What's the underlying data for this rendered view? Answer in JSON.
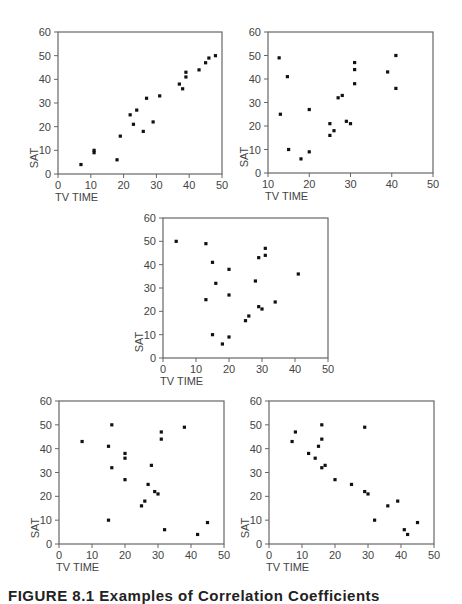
{
  "caption": "FIGURE 8.1 Examples of Correlation Coefficients",
  "chart_data": [
    {
      "type": "scatter",
      "title": "",
      "xlabel": "TV TIME",
      "ylabel": "SAT",
      "xlim": [
        0,
        50
      ],
      "ylim": [
        0,
        60
      ],
      "xticks": [
        0,
        10,
        20,
        30,
        40,
        50
      ],
      "yticks": [
        0,
        10,
        20,
        30,
        40,
        50,
        60
      ],
      "frame": {
        "x0": 58,
        "x1": 222,
        "y0": 32,
        "y1": 174
      },
      "points": [
        [
          7,
          4
        ],
        [
          11,
          9
        ],
        [
          11,
          10
        ],
        [
          18,
          6
        ],
        [
          19,
          16
        ],
        [
          22,
          25
        ],
        [
          23,
          21
        ],
        [
          24,
          27
        ],
        [
          26,
          18
        ],
        [
          27,
          32
        ],
        [
          29,
          22
        ],
        [
          31,
          33
        ],
        [
          37,
          38
        ],
        [
          38,
          36
        ],
        [
          39,
          41
        ],
        [
          39,
          43
        ],
        [
          43,
          44
        ],
        [
          45,
          47
        ],
        [
          46,
          49
        ],
        [
          48,
          50
        ]
      ]
    },
    {
      "type": "scatter",
      "title": "",
      "xlabel": "TV TIME",
      "ylabel": "SAT",
      "xlim": [
        10,
        50
      ],
      "ylim": [
        0,
        60
      ],
      "xticks": [
        10,
        20,
        30,
        40,
        50
      ],
      "yticks": [
        0,
        10,
        20,
        30,
        40,
        50,
        60
      ],
      "frame": {
        "x0": 268,
        "x1": 433,
        "y0": 32,
        "y1": 173
      },
      "points": [
        [
          12.7,
          49
        ],
        [
          13,
          25
        ],
        [
          14.7,
          41
        ],
        [
          15,
          10
        ],
        [
          18,
          6
        ],
        [
          20,
          27
        ],
        [
          20,
          9
        ],
        [
          25,
          21
        ],
        [
          25,
          16
        ],
        [
          26,
          18
        ],
        [
          27,
          32
        ],
        [
          28,
          33
        ],
        [
          29,
          22
        ],
        [
          30,
          21
        ],
        [
          31,
          47
        ],
        [
          31,
          44
        ],
        [
          31,
          38
        ],
        [
          39,
          43
        ],
        [
          41,
          50
        ],
        [
          41,
          36
        ]
      ]
    },
    {
      "type": "scatter",
      "title": "",
      "xlabel": "TV TIME",
      "ylabel": "SAT",
      "xlim": [
        0,
        50
      ],
      "ylim": [
        0,
        60
      ],
      "xticks": [
        0,
        10,
        20,
        30,
        40,
        50
      ],
      "yticks": [
        0,
        10,
        20,
        30,
        40,
        50,
        60
      ],
      "frame": {
        "x0": 163,
        "x1": 328,
        "y0": 218,
        "y1": 358
      },
      "points": [
        [
          4,
          50
        ],
        [
          13,
          49
        ],
        [
          13,
          25
        ],
        [
          15,
          41
        ],
        [
          15,
          10
        ],
        [
          16,
          32
        ],
        [
          18,
          6
        ],
        [
          20,
          38
        ],
        [
          20,
          27
        ],
        [
          20,
          9
        ],
        [
          25,
          16
        ],
        [
          26,
          18
        ],
        [
          28,
          33
        ],
        [
          29,
          43
        ],
        [
          29,
          22
        ],
        [
          30,
          21
        ],
        [
          31,
          47
        ],
        [
          31,
          44
        ],
        [
          34,
          24
        ],
        [
          41,
          36
        ]
      ]
    },
    {
      "type": "scatter",
      "title": "",
      "xlabel": "TV TIME",
      "ylabel": "SAT",
      "xlim": [
        0,
        50
      ],
      "ylim": [
        0,
        60
      ],
      "xticks": [
        0,
        10,
        20,
        30,
        40,
        50
      ],
      "yticks": [
        0,
        10,
        20,
        30,
        40,
        50,
        60
      ],
      "frame": {
        "x0": 59,
        "x1": 224,
        "y0": 401,
        "y1": 544
      },
      "points": [
        [
          7,
          43
        ],
        [
          15,
          41
        ],
        [
          15,
          10
        ],
        [
          16,
          50
        ],
        [
          16,
          32
        ],
        [
          20,
          38
        ],
        [
          20,
          36
        ],
        [
          20,
          27
        ],
        [
          25,
          16
        ],
        [
          26,
          18
        ],
        [
          27,
          25
        ],
        [
          28,
          33
        ],
        [
          29,
          22
        ],
        [
          30,
          21
        ],
        [
          31,
          47
        ],
        [
          31,
          44
        ],
        [
          32,
          6
        ],
        [
          38,
          49
        ],
        [
          42,
          4
        ],
        [
          45,
          9
        ]
      ]
    },
    {
      "type": "scatter",
      "title": "",
      "xlabel": "TV TIME",
      "ylabel": "SAT",
      "xlim": [
        0,
        50
      ],
      "ylim": [
        0,
        60
      ],
      "xticks": [
        0,
        10,
        20,
        30,
        40,
        50
      ],
      "yticks": [
        0,
        10,
        20,
        30,
        40,
        50,
        60
      ],
      "frame": {
        "x0": 269,
        "x1": 434,
        "y0": 401,
        "y1": 544
      },
      "points": [
        [
          7,
          43
        ],
        [
          8,
          47
        ],
        [
          12,
          38
        ],
        [
          14,
          36
        ],
        [
          15,
          41
        ],
        [
          16,
          50
        ],
        [
          16,
          44
        ],
        [
          16,
          32
        ],
        [
          17,
          33
        ],
        [
          20,
          27
        ],
        [
          25,
          25
        ],
        [
          29,
          49
        ],
        [
          29,
          22
        ],
        [
          30,
          21
        ],
        [
          32,
          10
        ],
        [
          36,
          16
        ],
        [
          39,
          18
        ],
        [
          41,
          6
        ],
        [
          42,
          4
        ],
        [
          45,
          9
        ]
      ]
    }
  ]
}
